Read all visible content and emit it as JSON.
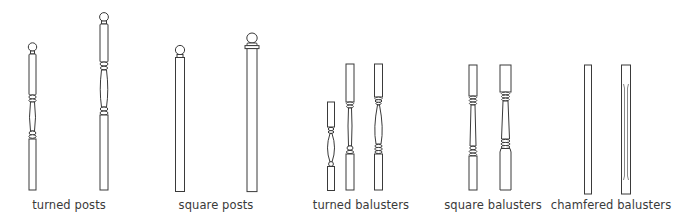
{
  "diagram": {
    "colors": {
      "line": "#3a3a3a",
      "background": "#ffffff"
    },
    "groups": [
      {
        "label": "turned posts",
        "items": [
          "turned-post-short",
          "turned-post-tall"
        ]
      },
      {
        "label": "square posts",
        "items": [
          "square-post-small-cap",
          "square-post-large-cap"
        ]
      },
      {
        "label": "turned balusters",
        "items": [
          "turned-baluster-short",
          "turned-baluster-slim",
          "turned-baluster-vase"
        ]
      },
      {
        "label": "square balusters",
        "items": [
          "square-baluster-slim",
          "square-baluster-wide"
        ]
      },
      {
        "label": "chamfered balusters",
        "items": [
          "chamfered-baluster-plain",
          "chamfered-baluster-stopped"
        ]
      }
    ]
  }
}
